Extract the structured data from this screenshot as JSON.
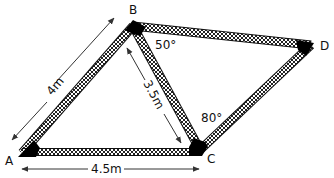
{
  "diagram": {
    "type": "geometry-figure",
    "vertices": {
      "A": {
        "label": "A"
      },
      "B": {
        "label": "B"
      },
      "C": {
        "label": "C"
      },
      "D": {
        "label": "D"
      }
    },
    "lengths": {
      "AB": "4m",
      "BC": "3.5m",
      "AC": "4.5m"
    },
    "angles": {
      "CBD": "50°",
      "BCD": "80°"
    },
    "edges": [
      "AB",
      "BC",
      "CA",
      "BD",
      "CD"
    ],
    "colors": {
      "beam_fill": "#ffffff",
      "beam_hatch": "#222222",
      "joint": "#000000",
      "arrow": "#333333"
    }
  }
}
